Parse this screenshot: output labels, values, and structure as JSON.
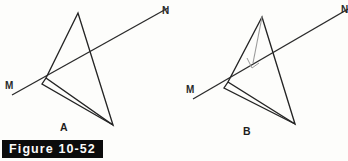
{
  "figure": {
    "caption": "Figure 10-52",
    "background_color": "#fdfdfb",
    "caption_bar_color": "#0c0c0c",
    "caption_text_color": "#fbfbfb",
    "stroke_color": "#242424",
    "altitude_color": "#9a9a9a",
    "width": 348,
    "height": 161
  },
  "panels": [
    {
      "id": "A",
      "label": "A",
      "label_pos": {
        "x": 63,
        "y": 128
      },
      "line": {
        "name": "line-MN",
        "start_label": "M",
        "end_label": "N",
        "start_label_pos": {
          "x": 6,
          "y": 88
        },
        "end_label_pos": {
          "x": 163,
          "y": 13
        },
        "start_point": {
          "x": 12,
          "y": 95
        },
        "end_point": {
          "x": 168,
          "y": 8
        }
      },
      "shape": {
        "name": "quadrilateral-A",
        "points": "78,13 46,78 113,125 78,13",
        "extra_points": "46,78 42,83 113,125"
      }
    },
    {
      "id": "B",
      "label": "B",
      "label_pos": {
        "x": 246,
        "y": 132
      },
      "line": {
        "name": "line-MN",
        "start_label": "M",
        "end_label": "N",
        "start_label_pos": {
          "x": 187,
          "y": 92
        },
        "end_label_pos": {
          "x": 341,
          "y": 11
        },
        "start_point": {
          "x": 193,
          "y": 99
        },
        "end_point": {
          "x": 347,
          "y": 9
        }
      },
      "shape": {
        "name": "quadrilateral-B",
        "points": "262,17 228,82 295,124 262,17",
        "extra_points": "228,82 224,87 295,124"
      },
      "altitude": {
        "name": "altitude-segment",
        "start_point": {
          "x": 262,
          "y": 17
        },
        "end_point": {
          "x": 253,
          "y": 63
        },
        "right_angle_marker": "247,59 252,68 258,63"
      }
    }
  ]
}
